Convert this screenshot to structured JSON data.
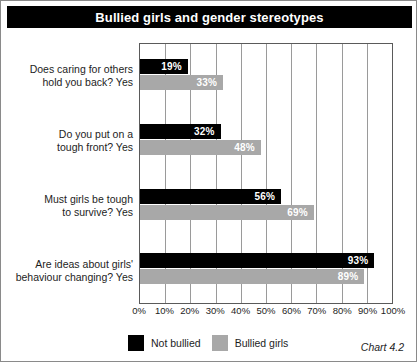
{
  "chart_data": {
    "type": "bar",
    "orientation": "horizontal",
    "title": "Bullied girls and gender stereotypes",
    "caption": "Chart 4.2",
    "xlabel": "",
    "ylabel": "",
    "xlim": [
      0,
      100
    ],
    "grid": true,
    "legend_position": "bottom-left",
    "tick_labels": [
      "0%",
      "10%",
      "20%",
      "30%",
      "40%",
      "50%",
      "60%",
      "70%",
      "80%",
      "90%",
      "100%"
    ],
    "tick_values": [
      0,
      10,
      20,
      30,
      40,
      50,
      60,
      70,
      80,
      90,
      100
    ],
    "categories": [
      "Does caring for others hold you back? Yes",
      "Do you put on a tough front? Yes",
      "Must girls be tough to survive? Yes",
      "Are ideas about girls' behaviour changing? Yes"
    ],
    "category_lines": [
      [
        "Does caring for others",
        "hold you back? Yes"
      ],
      [
        "Do you put on a",
        "tough front? Yes"
      ],
      [
        "Must girls be tough",
        "to survive? Yes"
      ],
      [
        "Are ideas about girls'",
        "behaviour changing? Yes"
      ]
    ],
    "series": [
      {
        "name": "Not bullied",
        "color": "#000000",
        "values": [
          19,
          32,
          56,
          93
        ],
        "value_labels": [
          "19%",
          "32%",
          "56%",
          "93%"
        ]
      },
      {
        "name": "Bullied girls",
        "color": "#A8A8A8",
        "values": [
          33,
          48,
          69,
          89
        ],
        "value_labels": [
          "33%",
          "48%",
          "69%",
          "89%"
        ]
      }
    ]
  }
}
